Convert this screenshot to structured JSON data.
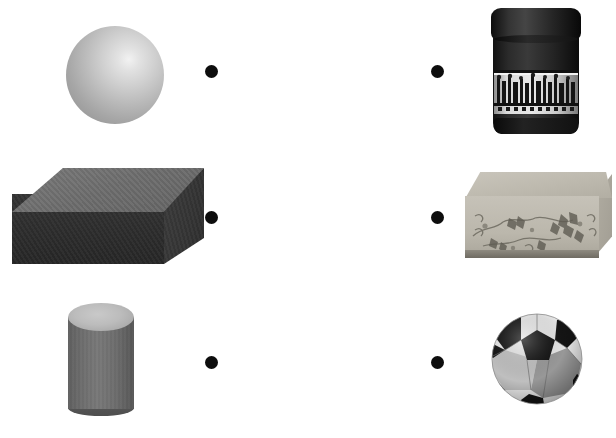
{
  "page": {
    "background_color": "#ffffff",
    "width": 616,
    "height": 438,
    "dot_color": "#0d0d0d"
  },
  "matching_rows": [
    {
      "row": 1,
      "left": {
        "name": "sphere",
        "label": "Sphere",
        "kind": "geometric-solid",
        "colors": {
          "highlight": "#f2f2f2",
          "mid": "#b9b9b9",
          "shadow": "#8f8f8f"
        },
        "position": {
          "x": 66,
          "y": 26,
          "width": 98,
          "height": 98
        }
      },
      "left_dot": {
        "label": "left connector dot",
        "x": 211,
        "y": 71,
        "diameter": 13
      },
      "right_dot": {
        "label": "right connector dot",
        "x": 437,
        "y": 71,
        "diameter": 13
      },
      "right": {
        "name": "tin-canister",
        "label": "Cylindrical tin canister with lid",
        "kind": "real-object",
        "colors": {
          "body": "#1a1a1a",
          "band": "#e0e0e0",
          "lid": "#141414"
        },
        "position": {
          "x": 491,
          "y": 8,
          "width": 90,
          "height": 127
        }
      }
    },
    {
      "row": 2,
      "left": {
        "name": "rectangular-prism",
        "label": "Rectangular prism",
        "kind": "geometric-solid",
        "colors": {
          "top": "#6c6c6c",
          "front": "#2c2c2c",
          "side": "#343434"
        },
        "position": {
          "x": 12,
          "y": 168,
          "width": 192,
          "height": 100
        }
      },
      "left_dot": {
        "label": "left connector dot",
        "x": 211,
        "y": 217,
        "diameter": 13
      },
      "right_dot": {
        "label": "right connector dot",
        "x": 437,
        "y": 217,
        "diameter": 13
      },
      "right": {
        "name": "decorated-box",
        "label": "Decorated rectangular box with floral pattern",
        "kind": "real-object",
        "colors": {
          "body": "#bbb7ac",
          "pattern": "#6d6a60",
          "base": "#6f6b62"
        },
        "position": {
          "x": 464,
          "y": 172,
          "width": 148,
          "height": 88
        }
      }
    },
    {
      "row": 3,
      "left": {
        "name": "cylinder",
        "label": "Cylinder",
        "kind": "geometric-solid",
        "colors": {
          "top": "#bcbcbc",
          "body": "#6e6e6e"
        },
        "position": {
          "x": 68,
          "y": 303,
          "width": 66,
          "height": 113
        }
      },
      "left_dot": {
        "label": "left connector dot",
        "x": 211,
        "y": 362,
        "diameter": 13
      },
      "right_dot": {
        "label": "right connector dot",
        "x": 437,
        "y": 362,
        "diameter": 13
      },
      "right": {
        "name": "soccer-ball",
        "label": "Black and white soccer ball",
        "kind": "real-object",
        "colors": {
          "white": "#f0f0f0",
          "grey": "#9a9a9a",
          "black": "#1a1a1a"
        },
        "position": {
          "x": 491,
          "y": 312,
          "width": 92,
          "height": 94
        }
      }
    }
  ]
}
